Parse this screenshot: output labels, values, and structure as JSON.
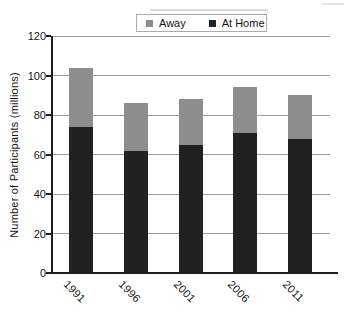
{
  "chart_data": {
    "type": "bar",
    "stacked": true,
    "categories": [
      "1991",
      "1996",
      "2001",
      "2006",
      "2011"
    ],
    "series": [
      {
        "name": "Away",
        "color": "#8d8d8d",
        "values": [
          30,
          24,
          23,
          23,
          22
        ]
      },
      {
        "name": "At Home",
        "color": "#212121",
        "values": [
          74,
          62,
          65,
          71,
          68
        ]
      }
    ],
    "stack_order_bottom_to_top": [
      "At Home",
      "Away"
    ],
    "xlabel": "",
    "ylabel": "Number of Participants (millions)",
    "ylim": [
      0,
      120
    ],
    "yticks": [
      0,
      20,
      40,
      60,
      80,
      100,
      120
    ],
    "grid": true,
    "legend_position": "top-center",
    "x_tick_rotation_deg": 45
  },
  "colors": {
    "gridline": "#9b9b9b",
    "axis": "#1f1f1f",
    "text": "#141414",
    "legend_border": "#ababab",
    "background": "#ffffff"
  }
}
